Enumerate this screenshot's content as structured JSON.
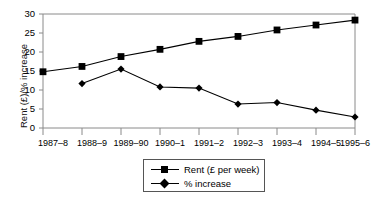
{
  "chart_data": {
    "type": "line",
    "title": "",
    "xlabel": "",
    "ylabel": "Rent (£)/% increase",
    "categories": [
      "1987–8",
      "1988–9",
      "1989–90",
      "1990–1",
      "1991–2",
      "1992–3",
      "1993–4",
      "1994–5",
      "1995–6"
    ],
    "series": [
      {
        "name": "Rent (£ per week)",
        "marker": "square",
        "values": [
          14.8,
          16.2,
          18.8,
          20.7,
          22.8,
          24.1,
          25.8,
          27.1,
          28.4
        ]
      },
      {
        "name": "% increase",
        "marker": "diamond",
        "values": [
          null,
          11.7,
          15.5,
          10.8,
          10.5,
          6.3,
          6.7,
          4.7,
          2.9
        ]
      }
    ],
    "ylim": [
      0,
      30
    ],
    "yticks": [
      0,
      5,
      10,
      15,
      20,
      25,
      30
    ],
    "ytick_labels": [
      "0",
      "5",
      "10",
      "15",
      "20",
      "25",
      "30"
    ],
    "grid": false,
    "legend_position": "bottom-center",
    "line_color": "#000000",
    "axis_color": "#808080",
    "background": "#ffffff"
  },
  "legend": {
    "items": [
      {
        "label": "Rent (£ per week)",
        "marker": "square-marker"
      },
      {
        "label": "% increase",
        "marker": "diamond-marker"
      }
    ]
  }
}
